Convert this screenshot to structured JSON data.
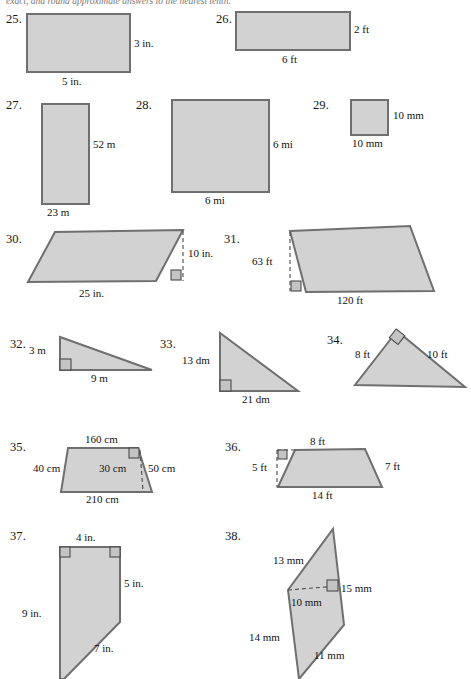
{
  "worksheet": {
    "instruction": "exact, and round approximate answers to the nearest tenth.",
    "units_note": ""
  },
  "problems": [
    {
      "number": "25.",
      "shape": "rectangle",
      "labels": {
        "right": "3 in.",
        "bottom": "5 in."
      }
    },
    {
      "number": "26.",
      "shape": "rectangle",
      "labels": {
        "right": "2 ft",
        "bottom": "6 ft"
      }
    },
    {
      "number": "27.",
      "shape": "rectangle",
      "labels": {
        "right": "52 m",
        "bottom": "23 m"
      }
    },
    {
      "number": "28.",
      "shape": "square",
      "labels": {
        "right": "6 mi",
        "bottom": "6 mi"
      }
    },
    {
      "number": "29.",
      "shape": "square",
      "labels": {
        "right": "10 mm",
        "bottom": "10 mm"
      }
    },
    {
      "number": "30.",
      "shape": "parallelogram",
      "labels": {
        "height": "10 in.",
        "base": "25 in."
      }
    },
    {
      "number": "31.",
      "shape": "parallelogram",
      "labels": {
        "height": "63 ft",
        "base": "120 ft"
      }
    },
    {
      "number": "32.",
      "shape": "right-triangle",
      "labels": {
        "leg_vertical": "3 m",
        "leg_horizontal": "9 m"
      }
    },
    {
      "number": "33.",
      "shape": "right-triangle",
      "labels": {
        "leg_vertical": "13 dm",
        "leg_horizontal": "21 dm"
      }
    },
    {
      "number": "34.",
      "shape": "right-triangle",
      "labels": {
        "leg_left": "8 ft",
        "leg_right": "10 ft"
      }
    },
    {
      "number": "35.",
      "shape": "trapezoid",
      "labels": {
        "top": "160 cm",
        "bottom": "210 cm",
        "left": "40 cm",
        "right": "50 cm",
        "height": "30 cm"
      }
    },
    {
      "number": "36.",
      "shape": "trapezoid",
      "labels": {
        "top": "8 ft",
        "bottom": "14 ft",
        "height": "5 ft",
        "right": "7 ft"
      }
    },
    {
      "number": "37.",
      "shape": "right-trapezoid",
      "labels": {
        "top": "4 in.",
        "right": "5 in.",
        "left": "9 in.",
        "diagonal": "7 in."
      }
    },
    {
      "number": "38.",
      "shape": "composite-quadrilateral",
      "labels": {
        "upper_left": "13 mm",
        "height_segment": "10 mm",
        "right": "15 mm",
        "left": "14 mm",
        "bottom": "11 mm"
      }
    }
  ],
  "style": {
    "figure_fill": "#d2d2d2",
    "figure_stroke": "#6f6f6f",
    "page_background": "#ffffff",
    "text_color": "#121212"
  }
}
